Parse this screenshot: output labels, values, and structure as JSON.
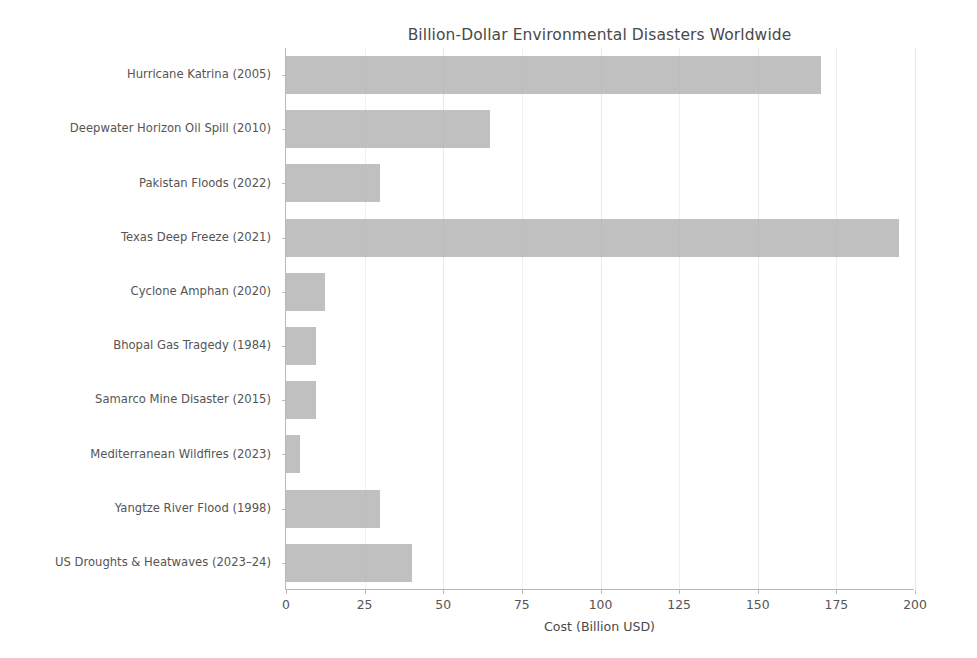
{
  "chart_data": {
    "type": "bar",
    "orientation": "horizontal",
    "title": "Billion-Dollar Environmental Disasters Worldwide",
    "xlabel": "Cost (Billion USD)",
    "ylabel": "",
    "xlim": [
      0,
      200
    ],
    "ylim": null,
    "grid": true,
    "legend": null,
    "bar_color": "#b0b0b0",
    "categories": [
      "Hurricane Katrina (2005)",
      "Deepwater Horizon Oil Spill (2010)",
      "Pakistan Floods (2022)",
      "Texas Deep Freeze (2021)",
      "Cyclone Amphan (2020)",
      "Bhopal Gas Tragedy (1984)",
      "Samarco Mine Disaster (2015)",
      "Mediterranean Wildfires (2023)",
      "Yangtze River Flood (1998)",
      "US Droughts & Heatwaves (2023–24)"
    ],
    "values": [
      170,
      65,
      30,
      195,
      12.5,
      9.5,
      9.5,
      4.5,
      30,
      40
    ],
    "xticks": [
      0,
      25,
      50,
      75,
      100,
      125,
      150,
      175,
      200
    ],
    "xticklabels": [
      "0",
      "25",
      "50",
      "75",
      "100",
      "125",
      "150",
      "175",
      "200"
    ]
  }
}
